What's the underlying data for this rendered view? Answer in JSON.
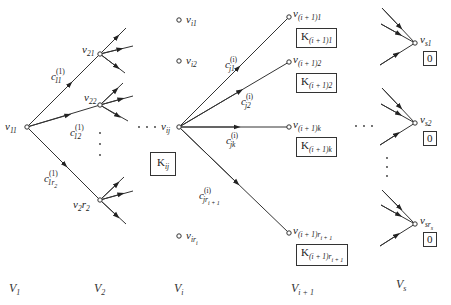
{
  "diagram": {
    "type": "multistage-graph",
    "columns": [
      {
        "id": "V1",
        "label": "V",
        "sub": "1"
      },
      {
        "id": "V2",
        "label": "V",
        "sub": "2"
      },
      {
        "id": "Vi",
        "label": "V",
        "sub": "i"
      },
      {
        "id": "Vi+1",
        "label": "V",
        "sub": "i + 1"
      },
      {
        "id": "Vs",
        "label": "V",
        "sub": "s"
      }
    ],
    "nodes": {
      "v11": {
        "base": "v",
        "sub": "11"
      },
      "v21": {
        "base": "v",
        "sub": "21"
      },
      "v22": {
        "base": "v",
        "sub": "22"
      },
      "v2r2": {
        "base": "v",
        "sub": "2",
        "mid": "r",
        "sub2": "2"
      },
      "vi1": {
        "base": "v",
        "sub": "i1"
      },
      "vi2": {
        "base": "v",
        "sub": "i2"
      },
      "vij": {
        "base": "v",
        "sub": "ij"
      },
      "viri": {
        "base": "v",
        "sub": "ir",
        "sub2": "i"
      },
      "vnext1": {
        "base": "v",
        "sub": "(i + 1)1"
      },
      "vnext2": {
        "base": "v",
        "sub": "(i + 1)2"
      },
      "vnextk": {
        "base": "v",
        "sub": "(i + 1)k"
      },
      "vnextr": {
        "base": "v",
        "sub": "(i + 1)r",
        "sub2": "i + 1"
      },
      "vs1": {
        "base": "v",
        "sub": "s1"
      },
      "vs2": {
        "base": "v",
        "sub": "s2"
      },
      "vsrs": {
        "base": "v",
        "sub": "sr",
        "sub2": "s"
      }
    },
    "edge_labels": {
      "c11": {
        "base": "c",
        "sup": "(1)",
        "sub": "11"
      },
      "c12": {
        "base": "c",
        "sup": "(1)",
        "sub": "12"
      },
      "c1r2": {
        "base": "c",
        "sup": "(1)",
        "sub": "1r",
        "sub2": "2"
      },
      "cj1": {
        "base": "c",
        "sup": "(i)",
        "sub": "j1"
      },
      "cj2": {
        "base": "c",
        "sup": "(i)",
        "sub": "j2"
      },
      "cjk": {
        "base": "c",
        "sup": "(i)",
        "sub": "jk"
      },
      "cjr": {
        "base": "c",
        "sup": "(i)",
        "sub": "jr",
        "sub2": "i + 1"
      }
    },
    "cost_boxes": {
      "Kij": {
        "base": "K",
        "sub": "ij"
      },
      "Knext1": {
        "base": "K",
        "sub": "(i + 1)1"
      },
      "Knext2": {
        "base": "K",
        "sub": "(i + 1)2"
      },
      "Knextk": {
        "base": "K",
        "sub": "(i + 1)k"
      },
      "Knextr": {
        "base": "K",
        "sub": "(i + 1)r",
        "sub2": "i + 1"
      },
      "Ks1": "0",
      "Ks2": "0",
      "Ksrs": "0"
    },
    "ellipsis": {
      "horizontal": "· · ·",
      "vertical": "⋮"
    }
  }
}
